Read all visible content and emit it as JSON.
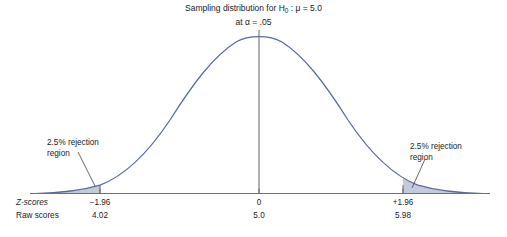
{
  "figure": {
    "title_line1_prefix": "Sampling distribution for H",
    "title_line1_sub": "0",
    "title_line1_suffix": " : μ = 5.0",
    "title_line2": "at α = .05",
    "curve_color": "#5a6a9e",
    "shade_color": "#c3cade",
    "axis_color": "#6e6e78",
    "center_line_color": "#6e6e78",
    "leader_color": "#55555f",
    "background": "#ffffff"
  },
  "annotations": {
    "left": {
      "line1": "2.5% rejection",
      "line2": "region"
    },
    "right": {
      "line1": "2.5% rejection",
      "line2": "region"
    }
  },
  "axis_rows": {
    "z_label": "Z-scores",
    "raw_label": "Raw scores"
  },
  "chart_data": {
    "type": "line",
    "title": "Sampling distribution for H0 : μ = 5.0 at α = .05",
    "xlabel": "",
    "ylabel": "",
    "distribution": "normal",
    "mean": 5.0,
    "alpha": 0.05,
    "grid": false,
    "legend": null,
    "ticks": [
      {
        "z": "−1.96",
        "raw": "4.02",
        "z_value": -1.96,
        "raw_value": 4.02,
        "px": 100
      },
      {
        "z": "0",
        "raw": "5.0",
        "z_value": 0,
        "raw_value": 5.0,
        "px": 259
      },
      {
        "z": "+1.96",
        "raw": "5.98",
        "z_value": 1.96,
        "raw_value": 5.98,
        "px": 403
      }
    ],
    "rejection_regions": [
      {
        "side": "left",
        "proportion": 0.025,
        "label": "2.5% rejection region",
        "z_cutoff": -1.96,
        "raw_cutoff": 4.02
      },
      {
        "side": "right",
        "proportion": 0.025,
        "label": "2.5% rejection region",
        "z_cutoff": 1.96,
        "raw_cutoff": 5.98
      }
    ]
  }
}
